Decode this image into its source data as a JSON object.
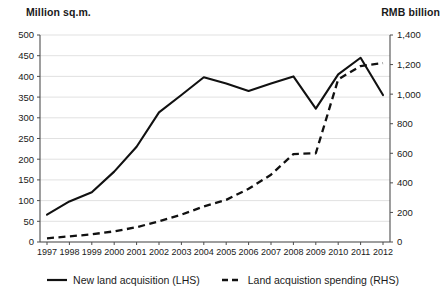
{
  "chart_data": {
    "type": "line",
    "title": "",
    "xlabel": "",
    "ylabel": "Million sq.m.",
    "y2label": "RMB billion",
    "grid": true,
    "legend_position": "bottom",
    "categories": [
      "1997",
      "1998",
      "1999",
      "2000",
      "2001",
      "2002",
      "2003",
      "2004",
      "2005",
      "2006",
      "2007",
      "2008",
      "2009",
      "2010",
      "2011",
      "2012"
    ],
    "left_axis": {
      "label": "Million sq.m.",
      "ylim": [
        0,
        500
      ],
      "ticks": [
        0,
        50,
        100,
        150,
        200,
        250,
        300,
        350,
        400,
        450,
        500
      ],
      "tick_labels": [
        "0",
        "50",
        "100",
        "150",
        "200",
        "250",
        "300",
        "350",
        "400",
        "450",
        "500"
      ]
    },
    "right_axis": {
      "label": "RMB billion",
      "ylim": [
        0,
        1400
      ],
      "ticks": [
        0,
        200,
        400,
        600,
        800,
        1000,
        1200,
        1400
      ],
      "tick_labels": [
        "0",
        "200",
        "400",
        "600",
        "800",
        "1,000",
        "1,200",
        "1,400"
      ]
    },
    "series": [
      {
        "name": "New land acquisition (LHS)",
        "axis": "left",
        "style": "solid",
        "color": "#111111",
        "values": [
          66,
          98,
          120,
          170,
          230,
          313,
          355,
          398,
          383,
          365,
          383,
          400,
          322,
          405,
          445,
          355
        ]
      },
      {
        "name": "Land acquistion spending (RHS)",
        "axis": "right",
        "style": "dashed",
        "color": "#111111",
        "values": [
          25,
          38,
          52,
          72,
          100,
          140,
          185,
          240,
          285,
          360,
          455,
          595,
          600,
          1100,
          1190,
          1210
        ]
      }
    ]
  },
  "legend": {
    "items": [
      {
        "label": "New land acquisition (LHS)",
        "style": "solid"
      },
      {
        "label": "Land acquistion spending (RHS)",
        "style": "dashed"
      }
    ]
  }
}
